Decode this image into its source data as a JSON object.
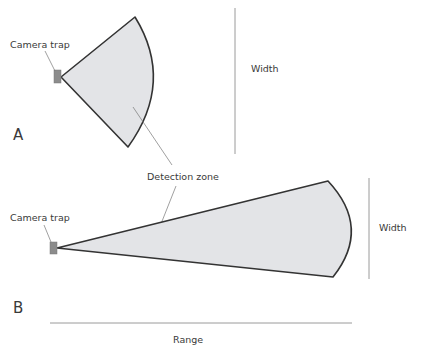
{
  "diagram": {
    "colors": {
      "zone_fill": "#e3e4e7",
      "zone_stroke": "#333333",
      "camera_fill": "#8c8c8c",
      "guide_line": "#9a9a9a",
      "text": "#3a3a3a"
    },
    "panel_a": {
      "letter": "A",
      "camera_label": "Camera trap",
      "width_label": "Width"
    },
    "panel_b": {
      "letter": "B",
      "camera_label": "Camera trap",
      "width_label": "Width",
      "range_label": "Range"
    },
    "shared_label": "Detection zone"
  }
}
